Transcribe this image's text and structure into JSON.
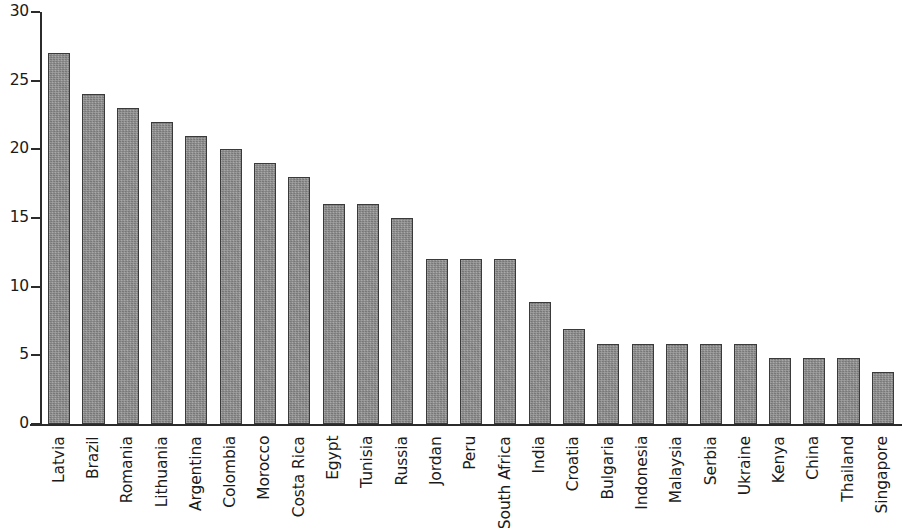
{
  "chart_data": {
    "type": "bar",
    "title": "",
    "subtitle": "",
    "xlabel": "",
    "ylabel": "",
    "ylim": [
      0,
      30
    ],
    "y_ticks": [
      0,
      5,
      10,
      15,
      20,
      25,
      30
    ],
    "y_tick_labels": [
      "0",
      "5",
      "10",
      "15",
      "20",
      "25",
      "30"
    ],
    "grid": false,
    "legend": null,
    "legend_position": "none",
    "bar_color": "#8e8e8e",
    "bar_edge_color": "#3a3a3a",
    "axis_color": "#2b2b2b",
    "categories": [
      "Latvia",
      "Brazil",
      "Romania",
      "Lithuania",
      "Argentina",
      "Colombia",
      "Morocco",
      "Costa Rica",
      "Egypt",
      "Tunisia",
      "Russia",
      "Jordan",
      "Peru",
      "South Africa",
      "India",
      "Croatia",
      "Bulgaria",
      "Indonesia",
      "Malaysia",
      "Serbia",
      "Ukraine",
      "Kenya",
      "China",
      "Thailand",
      "Singapore"
    ],
    "values": [
      27,
      24,
      23,
      22,
      21,
      20,
      19,
      18,
      16,
      16,
      15,
      12,
      12,
      12,
      8.9,
      6.9,
      5.8,
      5.8,
      5.8,
      5.8,
      5.8,
      4.8,
      4.8,
      4.8,
      3.8
    ]
  }
}
